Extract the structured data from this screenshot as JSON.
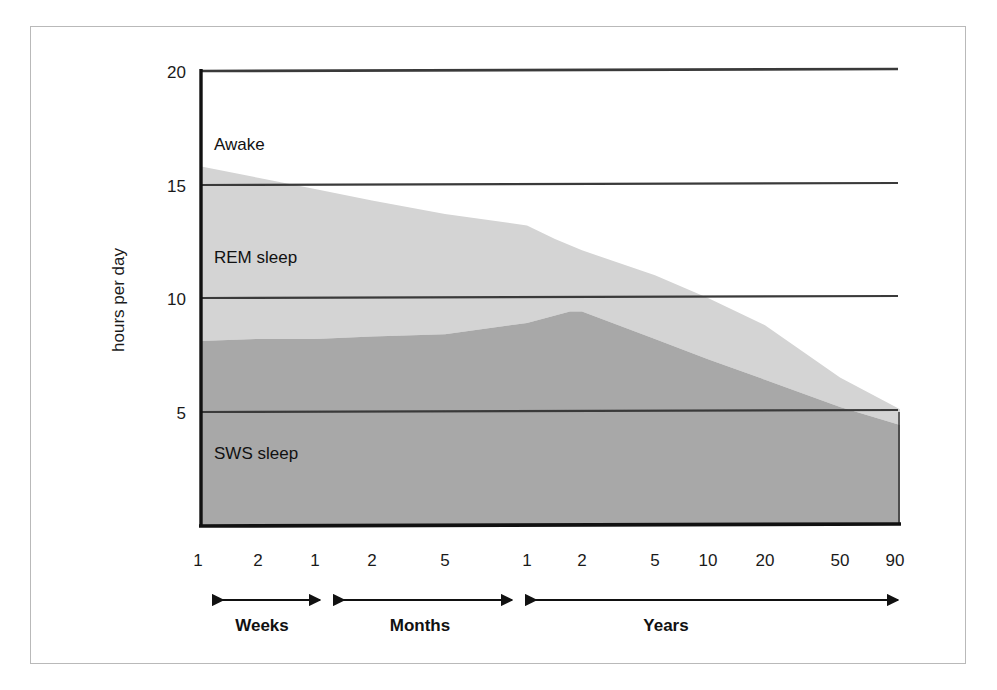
{
  "figure": {
    "ylabel": "hours per day",
    "band_labels": {
      "awake": "Awake",
      "rem": "REM sleep",
      "sws": "SWS sleep"
    },
    "era_labels": {
      "weeks": "Weeks",
      "months": "Months",
      "years": "Years"
    },
    "colors": {
      "awake_fill": "#ffffff",
      "rem_fill": "#d4d4d4",
      "sws_fill": "#a8a8a8",
      "axis": "#1a1a1a",
      "gridline": "#333333",
      "frame": "#b9b9b9",
      "text": "#111111"
    }
  },
  "chart_data": {
    "type": "area",
    "title": "",
    "subtitle": "",
    "xlabel": "",
    "ylabel": "hours per day",
    "ylim": [
      0,
      20
    ],
    "yticks": [
      5,
      10,
      15,
      20
    ],
    "ytick_labels": [
      "5",
      "10",
      "15",
      "20"
    ],
    "grid": true,
    "grid_axis": "y",
    "legend": "inline-band-labels",
    "stacking": "stacked-from-bottom",
    "x_scale": "piecewise-log-by-era",
    "x_eras": [
      {
        "name": "Weeks",
        "ticks": [
          1,
          2
        ]
      },
      {
        "name": "Months",
        "ticks": [
          1,
          2,
          5
        ]
      },
      {
        "name": "Years",
        "ticks": [
          1,
          2,
          5,
          10,
          20,
          50,
          90
        ]
      }
    ],
    "xtick_labels": [
      "1",
      "2",
      "1",
      "2",
      "5",
      "1",
      "2",
      "5",
      "10",
      "20",
      "50",
      "90"
    ],
    "xtick_positions_px": [
      198,
      258,
      315,
      372,
      445,
      527,
      582,
      655,
      708,
      765,
      840,
      895
    ],
    "series": [
      {
        "name": "SWS sleep",
        "color": "#a8a8a8",
        "order": 1,
        "note": "slow-wave (deep) sleep, measured from 0 hours upward",
        "points": [
          {
            "x_label": "1 week",
            "x_px": 200,
            "value": 8.1
          },
          {
            "x_label": "2 weeks",
            "x_px": 258,
            "value": 8.2
          },
          {
            "x_label": "1 month",
            "x_px": 315,
            "value": 8.2
          },
          {
            "x_label": "2 months",
            "x_px": 372,
            "value": 8.3
          },
          {
            "x_label": "5 months",
            "x_px": 445,
            "value": 8.4
          },
          {
            "x_label": "1 year",
            "x_px": 527,
            "value": 8.9
          },
          {
            "x_label": "1.5 years",
            "x_px": 570,
            "value": 9.4
          },
          {
            "x_label": "2 years",
            "x_px": 582,
            "value": 9.4
          },
          {
            "x_label": "5 years",
            "x_px": 655,
            "value": 8.2
          },
          {
            "x_label": "10 years",
            "x_px": 708,
            "value": 7.3
          },
          {
            "x_label": "20 years",
            "x_px": 765,
            "value": 6.4
          },
          {
            "x_label": "50 years",
            "x_px": 840,
            "value": 5.2
          },
          {
            "x_label": "90 years",
            "x_px": 900,
            "value": 4.4
          }
        ]
      },
      {
        "name": "REM sleep",
        "color": "#d4d4d4",
        "order": 2,
        "note": "REM sleep band sits on top of SWS; its upper edge is total sleep time",
        "total_sleep_points": [
          {
            "x_label": "1 week",
            "x_px": 200,
            "value": 15.8
          },
          {
            "x_label": "2 weeks",
            "x_px": 258,
            "value": 15.3
          },
          {
            "x_label": "1 month",
            "x_px": 315,
            "value": 14.8
          },
          {
            "x_label": "2 months",
            "x_px": 372,
            "value": 14.3
          },
          {
            "x_label": "5 months",
            "x_px": 445,
            "value": 13.7
          },
          {
            "x_label": "1 year",
            "x_px": 527,
            "value": 13.2
          },
          {
            "x_label": "1.5 years",
            "x_px": 555,
            "value": 12.6
          },
          {
            "x_label": "2 years",
            "x_px": 582,
            "value": 12.1
          },
          {
            "x_label": "5 years",
            "x_px": 655,
            "value": 11.0
          },
          {
            "x_label": "10 years",
            "x_px": 708,
            "value": 10.0
          },
          {
            "x_label": "20 years",
            "x_px": 765,
            "value": 8.8
          },
          {
            "x_label": "50 years",
            "x_px": 840,
            "value": 6.5
          },
          {
            "x_label": "90 years",
            "x_px": 900,
            "value": 5.1
          }
        ],
        "derived_rem_values": [
          7.7,
          7.1,
          6.6,
          6.0,
          5.3,
          4.3,
          2.7,
          2.8,
          1.5,
          0.7,
          0.7
        ]
      },
      {
        "name": "Awake",
        "color": "#ffffff",
        "order": 3,
        "note": "remainder of the 24-hour day above total sleep time; plot is clipped at 20 h"
      }
    ]
  }
}
